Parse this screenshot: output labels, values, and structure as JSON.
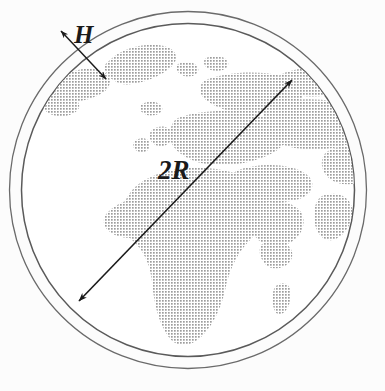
{
  "figure": {
    "type": "scientific-diagram",
    "background_color": "#fcfcfc",
    "labels": {
      "thickness": "H",
      "diameter": "2R"
    },
    "geometry": {
      "center_x": 188,
      "center_y": 190,
      "globe_radius": 167,
      "atmosphere_radius": 179,
      "shell_thickness": 12,
      "diameter_arrow": {
        "x1": 79,
        "y1": 301,
        "x2": 292,
        "y2": 80,
        "double_headed": true
      },
      "thickness_arrow": {
        "x1": 61,
        "y1": 31,
        "x2": 106,
        "y2": 79,
        "double_headed": true
      }
    },
    "colors": {
      "land": "#b9b9b9",
      "ocean": "#ffffff",
      "outline": "#555555",
      "arrow": "#1a1a1a",
      "label": "#1a1a1a"
    },
    "land_regions": [
      "greenland",
      "north-america-east",
      "iceland",
      "scandinavia",
      "europe",
      "british-isles",
      "africa",
      "arabia",
      "middle-east",
      "central-asia",
      "india",
      "southeast-asia",
      "madagascar"
    ]
  }
}
